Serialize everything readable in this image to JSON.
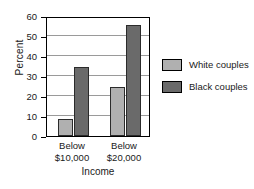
{
  "chart_data": {
    "type": "bar",
    "title": "",
    "subtitle": "",
    "xlabel": "Income",
    "ylabel": "Percent",
    "categories": [
      "Below $10,000",
      "Below $20,000"
    ],
    "category_lines": [
      {
        "line1": "Below",
        "line2": "$10,000"
      },
      {
        "line1": "Below",
        "line2": "$20,000"
      }
    ],
    "series": [
      {
        "name": "White couples",
        "values": [
          8.5,
          24.5
        ],
        "color": "#b0b0b0"
      },
      {
        "name": "Black couples",
        "values": [
          34.5,
          55.5
        ],
        "color": "#6a6a6a"
      }
    ],
    "ylim": [
      0,
      60
    ],
    "yticks": [
      0,
      10,
      20,
      30,
      40,
      50,
      60
    ],
    "ytick_labels": [
      "0",
      "10",
      "20",
      "30",
      "40",
      "50",
      "60"
    ],
    "grid": true,
    "grid_axis": "y",
    "legend_position": "right",
    "frame": true
  },
  "colors": {
    "background": "#ffffff",
    "axis": "#000000",
    "gridline": "#9a9a9a",
    "bar_outline": "#2b2b2b",
    "white_couples": "#b0b0b0",
    "black_couples": "#6a6a6a"
  }
}
